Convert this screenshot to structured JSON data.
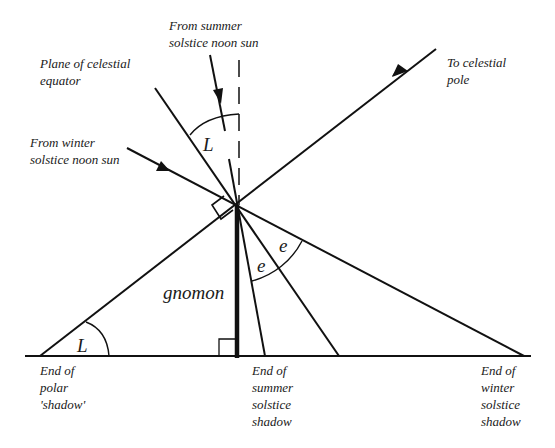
{
  "diagram": {
    "colors": {
      "ink": "#111111",
      "background": "#ffffff"
    },
    "labels": {
      "summer_sun": [
        "From summer",
        "solstice noon sun"
      ],
      "celestial_equator": [
        "Plane of celestial",
        "equator"
      ],
      "winter_sun": [
        "From winter",
        "solstice noon sun"
      ],
      "celestial_pole": [
        "To celestial",
        "pole"
      ],
      "gnomon": "gnomon",
      "polar_shadow": [
        "End of",
        "polar",
        "'shadow'"
      ],
      "summer_shadow": [
        "End of",
        "summer",
        "solstice",
        "shadow"
      ],
      "winter_shadow": [
        "End of",
        "winter",
        "solstice",
        "shadow"
      ]
    },
    "angle_symbols": {
      "latitude_top": "L",
      "latitude_bottom": "L",
      "obliquity_1": "e",
      "obliquity_2": "e"
    }
  }
}
